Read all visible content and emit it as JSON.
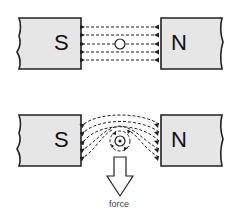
{
  "diagram": {
    "top": {
      "left_magnet": {
        "label": "S"
      },
      "right_magnet": {
        "label": "N"
      },
      "field_lines": 5,
      "conductor": "wire-no-current"
    },
    "bottom": {
      "left_magnet": {
        "label": "S"
      },
      "right_magnet": {
        "label": "N"
      },
      "field_lines": 5,
      "conductor": "wire-current-out-of-page",
      "arrow_label": "force"
    },
    "colors": {
      "magnet_fill": "#e6e6e6",
      "stroke": "#222222",
      "background": "#ffffff"
    }
  }
}
